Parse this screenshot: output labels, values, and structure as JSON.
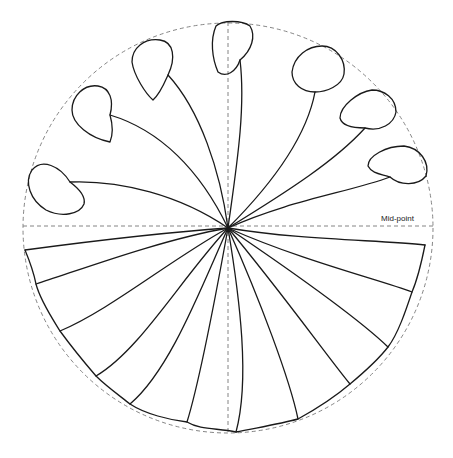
{
  "diagram": {
    "labels": {
      "mid_point": "Mid-point"
    },
    "colors": {
      "line": "#1a1a1a",
      "guide": "#777777",
      "background": "#ffffff"
    },
    "circle": {
      "cx": 228,
      "cy": 228,
      "r": 205
    },
    "center": {
      "x": 228,
      "y": 228
    },
    "bulbs": [
      {
        "name": "bulb-left",
        "tip": [
          63,
          183
        ],
        "cx": 55,
        "cy": 180
      },
      {
        "name": "bulb-upper-left-1",
        "tip": [
          110,
          115
        ],
        "cx": 96,
        "cy": 109
      },
      {
        "name": "bulb-upper-left-2",
        "tip": [
          168,
          75
        ],
        "cx": 158,
        "cy": 65
      },
      {
        "name": "bulb-top",
        "tip": [
          240,
          60
        ],
        "cx": 226,
        "cy": 30
      },
      {
        "name": "bulb-upper-right-1",
        "tip": [
          315,
          92
        ],
        "cx": 320,
        "cy": 70
      },
      {
        "name": "bulb-upper-right-2",
        "tip": [
          365,
          128
        ],
        "cx": 367,
        "cy": 117
      },
      {
        "name": "bulb-right",
        "tip": [
          390,
          177
        ],
        "cx": 400,
        "cy": 172
      }
    ],
    "scallop_count": 11
  }
}
